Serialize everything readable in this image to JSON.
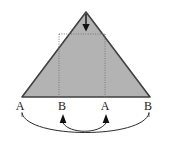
{
  "figure": {
    "shape": {
      "name": "triangle",
      "fill_color": "#b3b3b3",
      "stroke_color": "#404040",
      "apex_x": 86,
      "apex_y": 12,
      "base_left_x": 22,
      "base_right_x": 150,
      "base_y": 97
    },
    "inscribed_rectangle": {
      "name": "dotted-rectangle",
      "style": "dotted",
      "stroke_color": "#7a7a7a",
      "left_x": 59,
      "right_x": 105,
      "top_y": 34,
      "bottom_y": 97
    },
    "apex_marker": {
      "name": "down-arrow",
      "direction": "down",
      "color": "#111111",
      "x": 86,
      "y_top": 16,
      "y_tip": 30
    },
    "base_labels": [
      {
        "text": "A",
        "x": 20,
        "y": 100,
        "tick": "none"
      },
      {
        "text": "B",
        "x": 62,
        "y": 100,
        "tick": "up-arrow"
      },
      {
        "text": "A",
        "x": 105,
        "y": 100,
        "tick": "up-arrow"
      },
      {
        "text": "B",
        "x": 148,
        "y": 100,
        "tick": "none"
      }
    ],
    "tick_arrows": [
      {
        "name": "up-arrow-b1",
        "x": 63,
        "y_tip": 115,
        "y_base": 124
      },
      {
        "name": "up-arrow-a2",
        "x": 106,
        "y_tip": 115,
        "y_base": 124
      }
    ],
    "arcs": [
      {
        "name": "inner-arc",
        "from_x": 63,
        "to_x": 106,
        "y_start": 124,
        "sag_y": 133,
        "color": "#2b2b2b"
      },
      {
        "name": "outer-arc",
        "from_x": 22,
        "to_x": 149,
        "y_start": 113,
        "sag_y": 138,
        "color": "#2b2b2b"
      }
    ],
    "colors": {
      "background": "#ffffff",
      "triangle_fill": "#b3b3b3",
      "triangle_stroke": "#404040",
      "dotted_stroke": "#7a7a7a",
      "text": "#1a1a1a",
      "arc": "#2b2b2b"
    }
  }
}
